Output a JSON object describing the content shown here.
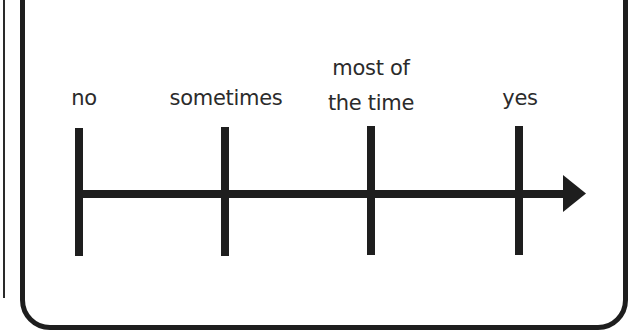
{
  "diagram": {
    "type": "rating-scale",
    "orientation": "horizontal",
    "arrow_direction": "right",
    "labels": [
      {
        "id": "no",
        "lines": [
          "no"
        ]
      },
      {
        "id": "sometimes",
        "lines": [
          "sometimes"
        ]
      },
      {
        "id": "most-of-the-time",
        "lines": [
          "most of",
          "the time"
        ]
      },
      {
        "id": "yes",
        "lines": [
          "yes"
        ]
      }
    ],
    "colors": {
      "line": "#1e1e1e",
      "text": "#2b2b2b",
      "background": "#ffffff"
    }
  }
}
